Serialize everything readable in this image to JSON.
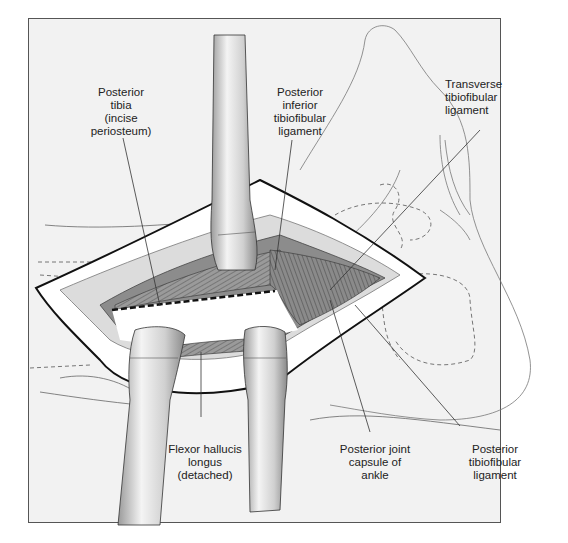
{
  "figure": {
    "labels": {
      "posterior_tibia": "Posterior\ntibia\n(incise\nperiosteum)",
      "posterior_inferior_tibiofibular_ligament": "Posterior\ninferior\ntibiofibular\nligament",
      "transverse_tibiofibular_ligament": "Transverse\ntibiofibular\nligament",
      "flexor_hallucis_longus": "Flexor hallucis\nlongus\n(detached)",
      "posterior_joint_capsule": "Posterior joint\ncapsule of\nankle",
      "posterior_tibiofibular_ligament": "Posterior\ntibiofibular\nligament"
    },
    "colors": {
      "background": "#f2f2f2",
      "frame_border": "#555555",
      "skin_flap": "#ffffff",
      "retractor_light": "#e6e6e6",
      "retractor_dark": "#8c8c8c",
      "tissue_dark": "#7a7a7a",
      "tissue_mid": "#a6a6a6",
      "outline": "#111111"
    }
  }
}
